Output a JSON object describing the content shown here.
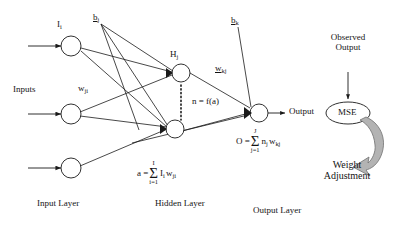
{
  "diagram": {
    "labels": {
      "inputs": "Inputs",
      "input_symbol": "I",
      "input_symbol_sub": "i",
      "weight_ji": "w",
      "weight_ji_sub": "ji",
      "bias_j": "b",
      "bias_j_sub": "j",
      "hidden_symbol": "H",
      "hidden_symbol_sub": "j",
      "activation": "n = f(a)",
      "weight_kj": "w",
      "weight_kj_sub": "kj",
      "bias_k": "b",
      "bias_k_sub": "k",
      "output": "Output",
      "observed_output_line1": "Observed",
      "observed_output_line2": "Output",
      "mse": "MSE",
      "weight_adjustment_line1": "Weight",
      "weight_adjustment_line2": "Adjustment",
      "input_layer": "Input Layer",
      "hidden_layer": "Hidden Layer",
      "output_layer": "Output Layer"
    },
    "formulas": {
      "activation_sum": {
        "lhs": "a =",
        "sigma_top": "I",
        "sigma": "Σ",
        "sigma_bottom": "i=1",
        "term_base_1": "I",
        "term_sub_1": "i",
        "term_base_2": "w",
        "term_sub_2": "ji"
      },
      "output_sum": {
        "lhs": "O =",
        "sigma_top": "J",
        "sigma": "Σ",
        "sigma_bottom": "j=1",
        "term_base_1": "n",
        "term_sub_1": "j",
        "term_base_2": "w",
        "term_sub_2": "kj"
      }
    },
    "colors": {
      "stroke": "#1a1a1a",
      "text": "#141414",
      "background": "#ffffff",
      "weight_arrow_fill": "#b3b3b3",
      "weight_arrow_stroke": "#6e6e6e"
    },
    "nodes": {
      "input_nodes": 3,
      "hidden_nodes_shown": 1,
      "output_nodes": 1,
      "mse_node": 1
    }
  }
}
